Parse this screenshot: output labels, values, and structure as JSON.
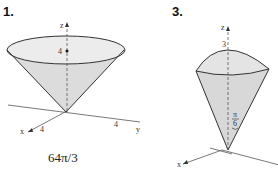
{
  "figures": [
    {
      "number": "1.",
      "axes": {
        "x": "x",
        "y": "y",
        "z": "z"
      },
      "labels": {
        "height": "4",
        "x_tick": "4",
        "y_tick": "4"
      },
      "answer": "64π/3"
    },
    {
      "number": "3.",
      "axes": {
        "x": "x",
        "z": "z"
      },
      "labels": {
        "top": "3",
        "angle_num": "π",
        "angle_den": "6"
      }
    }
  ]
}
